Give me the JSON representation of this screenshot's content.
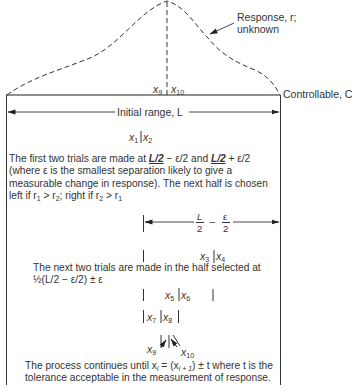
{
  "diagram": {
    "curve": {
      "label_line1": "Response, r;",
      "label_line2": "unknown",
      "style": "dashed",
      "color": "#333333"
    },
    "axis": {
      "label": "Controllable, C"
    },
    "initial_range": {
      "label": "Initial range, L"
    },
    "peak_markers": {
      "left": "x",
      "left_sub": "9",
      "right": "x",
      "right_sub": "10"
    },
    "steps": [
      {
        "markers": {
          "left": "x",
          "left_sub": "1",
          "right": "x",
          "right_sub": "2"
        },
        "text_parts": {
          "a": "The first two trials are made at ",
          "b": "L/2",
          "c": " − ε/2 and ",
          "d": "L/2",
          "e": " + ε/2 (where ε is the smallest separation likely to give a measurable change in response). The next half is chosen left if r",
          "f": "1",
          "g": " > r",
          "h": "2",
          "i": "; right if r",
          "j": "2",
          "k": " > r",
          "l": "1"
        }
      },
      {
        "dimension": {
          "num1": "L",
          "den1": "2",
          "minus": "−",
          "num2": "ε",
          "den2": "2"
        },
        "markers": {
          "left": "x",
          "left_sub": "3",
          "right": "x",
          "right_sub": "4"
        },
        "text_line1": "The next two trials are made in the half selected at",
        "text_line2": "½(L/2 − ε/2) ± ε"
      },
      {
        "markers": {
          "left": "x",
          "left_sub": "5",
          "right": "x",
          "right_sub": "6"
        }
      },
      {
        "markers": {
          "left": "x",
          "left_sub": "7",
          "right": "x",
          "right_sub": "8"
        }
      },
      {
        "markers": {
          "left": "x",
          "left_sub": "9",
          "right": "x",
          "right_sub": "10"
        },
        "text_parts": {
          "a": "The process continues until x",
          "b": "i",
          "c": " = (x",
          "d": "i + 1",
          "e": ") ± t where t is the tolerance acceptable in the measurement of response."
        }
      }
    ]
  }
}
